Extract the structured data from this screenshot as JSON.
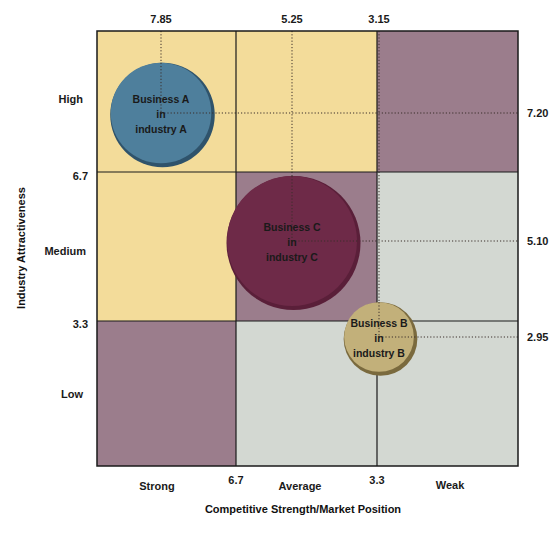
{
  "chart_data": {
    "type": "bubble-matrix",
    "title": "",
    "xlabel": "Competitive Strength/Market Position",
    "ylabel": "Industry Attractiveness",
    "xlim": [
      10,
      0
    ],
    "ylim": [
      0,
      10
    ],
    "x_boundaries": [
      6.7,
      3.3
    ],
    "y_boundaries": [
      6.7,
      3.3
    ],
    "x_boundary_labels": [
      "6.7",
      "3.3"
    ],
    "y_boundary_labels": [
      "6.7",
      "3.3"
    ],
    "x_categories": [
      "Strong",
      "Average",
      "Weak"
    ],
    "y_categories": [
      "High",
      "Medium",
      "Low"
    ],
    "cells": [
      {
        "row": "High",
        "col": "Strong",
        "zone": "yellow"
      },
      {
        "row": "High",
        "col": "Average",
        "zone": "yellow"
      },
      {
        "row": "High",
        "col": "Weak",
        "zone": "mauve"
      },
      {
        "row": "Medium",
        "col": "Strong",
        "zone": "yellow"
      },
      {
        "row": "Medium",
        "col": "Average",
        "zone": "mauve"
      },
      {
        "row": "Medium",
        "col": "Weak",
        "zone": "gray"
      },
      {
        "row": "Low",
        "col": "Strong",
        "zone": "mauve"
      },
      {
        "row": "Low",
        "col": "Average",
        "zone": "gray"
      },
      {
        "row": "Low",
        "col": "Weak",
        "zone": "gray"
      }
    ],
    "zone_colors": {
      "yellow": "#f3dc9a",
      "mauve": "#9b7d8c",
      "gray": "#d3d8d2"
    },
    "series": [
      {
        "name": "Business A in industry A",
        "lines": [
          "Business A",
          "in",
          "industry A"
        ],
        "x": 7.85,
        "y": 7.2,
        "x_label": "7.85",
        "y_label": "7.20",
        "relative_size": 0.78,
        "color": "#4e7f9c",
        "rim": "#2f536b"
      },
      {
        "name": "Business C in industry C",
        "lines": [
          "Business C",
          "in",
          "industry C"
        ],
        "x": 5.25,
        "y": 5.1,
        "x_label": "5.25",
        "y_label": "5.10",
        "relative_size": 1.0,
        "color": "#6e2a48",
        "rim": "#5a1f39"
      },
      {
        "name": "Business B in industry B",
        "lines": [
          "Business B",
          "in",
          "industry B"
        ],
        "x": 3.15,
        "y": 2.95,
        "x_label": "3.15",
        "y_label": "2.95",
        "relative_size": 0.55,
        "color": "#c2b07a",
        "rim": "#7a6a3e"
      }
    ],
    "grid": false,
    "legend": "none"
  }
}
